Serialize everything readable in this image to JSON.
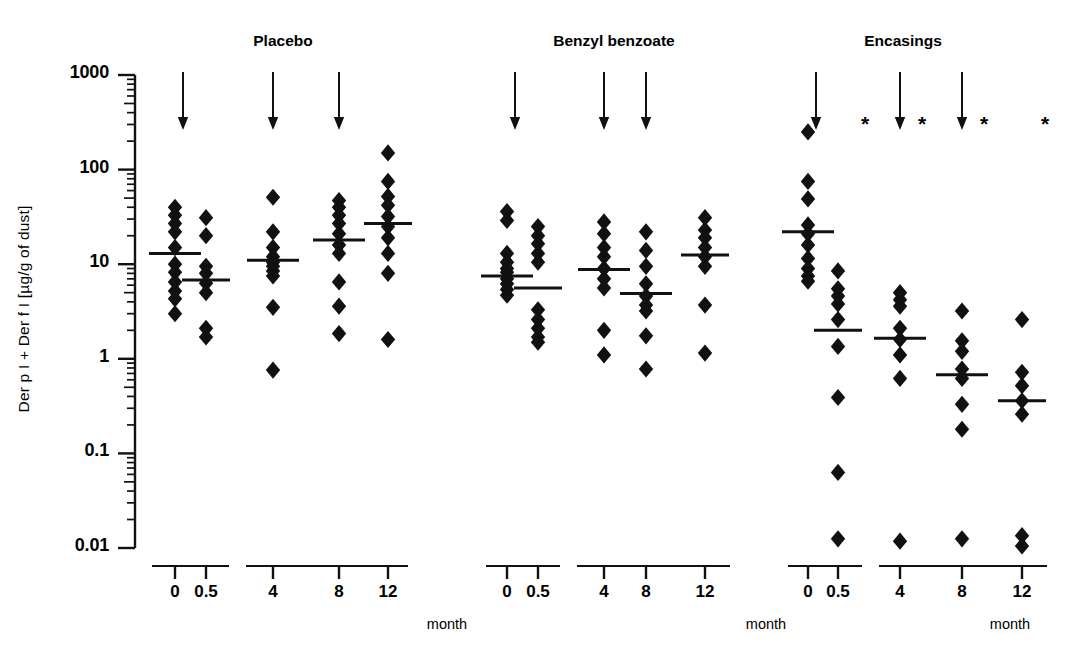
{
  "figure": {
    "yaxis": {
      "label": "Der p I + Der f I  [µg/g of dust]",
      "ticks": [
        "1000",
        "100",
        "10",
        "1",
        "0.1",
        "0.01"
      ],
      "scale": "log",
      "min": 0.01,
      "max": 1000
    },
    "xaxis": {
      "unit_label": "month",
      "tick_labels": [
        "0",
        "0.5",
        "4",
        "8",
        "12"
      ]
    },
    "annotations": {
      "arrow_symbol": "treatment-arrow",
      "star_symbol": "*"
    },
    "colors": {
      "ink": "#111111",
      "background": "#ffffff",
      "marker": "#111111"
    }
  },
  "chart_data": {
    "type": "scatter",
    "title": "",
    "xlabel": "month",
    "ylabel": "Der p I + Der f I [µg/g of dust]",
    "yscale": "log",
    "ylim": [
      0.01,
      1000
    ],
    "ytick_labels": [
      "1000",
      "100",
      "10",
      "1",
      "0.1",
      "0.01"
    ],
    "x_categories": [
      "0",
      "0.5",
      "4",
      "8",
      "12"
    ],
    "groups": [
      {
        "name": "Placebo",
        "columns": [
          {
            "month": "0",
            "median": 13.0,
            "values": [
              40,
              33,
              27,
              22,
              15,
              10,
              8.2,
              6.5,
              5.2,
              4.3,
              3.0
            ],
            "stars": false
          },
          {
            "month": "0.5",
            "median": 6.8,
            "values": [
              31,
              20,
              9.5,
              8.0,
              6.3,
              5.0,
              2.1,
              1.7
            ],
            "stars": false
          },
          {
            "month": "4",
            "median": 11.0,
            "values": [
              51,
              22,
              15,
              12,
              10.5,
              9.5,
              8.5,
              7.5,
              3.5,
              0.76
            ],
            "stars": false
          },
          {
            "month": "8",
            "median": 18.0,
            "values": [
              47,
              40,
              33,
              27,
              21,
              16,
              13,
              6.5,
              3.6,
              1.85
            ],
            "stars": false
          },
          {
            "month": "12",
            "median": 27.0,
            "values": [
              150,
              75,
              52,
              42,
              32,
              25,
              19,
              13,
              8.0,
              1.6
            ],
            "stars": false
          }
        ]
      },
      {
        "name": "Benzyl benzoate",
        "columns": [
          {
            "month": "0",
            "median": 7.5,
            "values": [
              36,
              29,
              13,
              10.5,
              9.0,
              8.2,
              7.0,
              6.2,
              5.4,
              4.7
            ],
            "stars": false
          },
          {
            "month": "0.5",
            "median": 5.6,
            "values": [
              25,
              20,
              16.5,
              13,
              10.5,
              3.3,
              2.6,
              2.1,
              1.7,
              1.5
            ],
            "stars": false
          },
          {
            "month": "4",
            "median": 8.8,
            "values": [
              28,
              21,
              15,
              12,
              9.0,
              7.0,
              5.6,
              2.0,
              1.1
            ],
            "stars": false
          },
          {
            "month": "8",
            "median": 4.9,
            "values": [
              22,
              14,
              9.5,
              6.2,
              4.6,
              3.7,
              3.2,
              1.75,
              0.78
            ],
            "stars": false
          },
          {
            "month": "12",
            "median": 12.5,
            "values": [
              31,
              23,
              19,
              15,
              12,
              9.5,
              3.7,
              1.15
            ],
            "stars": false
          }
        ]
      },
      {
        "name": "Encasings",
        "columns": [
          {
            "month": "0",
            "median": 22.0,
            "values": [
              250,
              75,
              49,
              26,
              21,
              16,
              11.5,
              9.0,
              7.5,
              6.6
            ],
            "stars": false
          },
          {
            "month": "0.5",
            "median": 2.0,
            "values": [
              8.5,
              5.5,
              4.6,
              3.8,
              2.6,
              1.35,
              0.39,
              0.063,
              0.0125
            ],
            "stars": true
          },
          {
            "month": "4",
            "median": 1.65,
            "values": [
              5.0,
              4.2,
              3.6,
              2.1,
              1.6,
              1.1,
              0.62,
              0.0118
            ],
            "stars": true
          },
          {
            "month": "8",
            "median": 0.68,
            "values": [
              3.2,
              1.55,
              1.2,
              0.78,
              0.62,
              0.33,
              0.18,
              0.0125
            ],
            "stars": true
          },
          {
            "month": "12",
            "median": 0.36,
            "values": [
              2.6,
              0.72,
              0.52,
              0.36,
              0.26,
              0.0135,
              0.0105
            ],
            "stars": true
          }
        ]
      }
    ],
    "treatment_arrows": {
      "months": [
        "0",
        "4",
        "8"
      ],
      "count_per_group": 3,
      "description": "downward arrows marking treatment application"
    },
    "significance_markers": {
      "symbol": "*",
      "group": "Encasings",
      "at_months": [
        "0.5",
        "4",
        "8",
        "12"
      ]
    }
  }
}
